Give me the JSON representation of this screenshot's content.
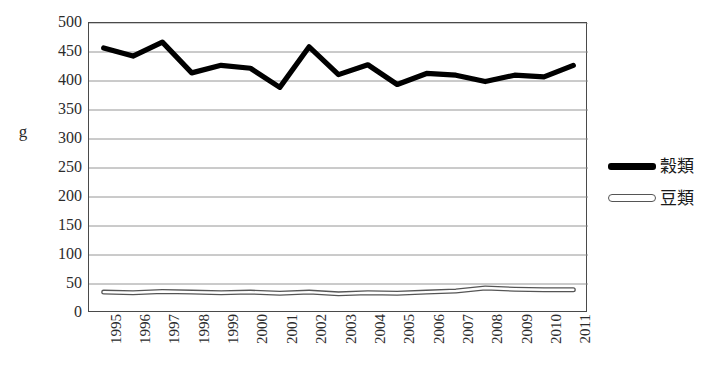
{
  "chart_data": {
    "type": "line",
    "title": "",
    "xlabel": "",
    "ylabel": "g",
    "ylim": [
      0,
      500
    ],
    "ytick_step": 50,
    "yticks": [
      500,
      450,
      400,
      350,
      300,
      250,
      200,
      150,
      100,
      50,
      0
    ],
    "grid": true,
    "legend_position": "right",
    "categories": [
      "1995",
      "1996",
      "1997",
      "1998",
      "1999",
      "2000",
      "2001",
      "2002",
      "2003",
      "2004",
      "2005",
      "2006",
      "2007",
      "2008",
      "2009",
      "2010",
      "2011"
    ],
    "series": [
      {
        "name": "穀類",
        "style": "solid-thick-black",
        "color": "#000000",
        "values": [
          457,
          443,
          467,
          414,
          427,
          422,
          389,
          459,
          411,
          428,
          394,
          413,
          410,
          399,
          410,
          407,
          427
        ]
      },
      {
        "name": "豆類",
        "style": "hollow-outline",
        "color": "#555555",
        "values": [
          36,
          35,
          37,
          36,
          35,
          36,
          34,
          36,
          33,
          35,
          34,
          36,
          38,
          43,
          41,
          40,
          40
        ]
      }
    ]
  },
  "axis": {
    "y_title": "g",
    "y_tick_labels": [
      "500",
      "450",
      "400",
      "350",
      "300",
      "250",
      "200",
      "150",
      "100",
      "50",
      "0"
    ],
    "x_tick_labels": [
      "1995",
      "1996",
      "1997",
      "1998",
      "1999",
      "2000",
      "2001",
      "2002",
      "2003",
      "2004",
      "2005",
      "2006",
      "2007",
      "2008",
      "2009",
      "2010",
      "2011"
    ]
  },
  "legend": {
    "items": [
      {
        "label": "穀類",
        "swatch": "solid-line-swatch"
      },
      {
        "label": "豆類",
        "swatch": "hollow-line-swatch"
      }
    ]
  },
  "colors": {
    "series_1": "#000000",
    "series_2": "#555555",
    "gridline": "#8a8a8a",
    "plot_border": "#4a4a4a",
    "background": "#ffffff",
    "text": "#2b2b2b"
  }
}
